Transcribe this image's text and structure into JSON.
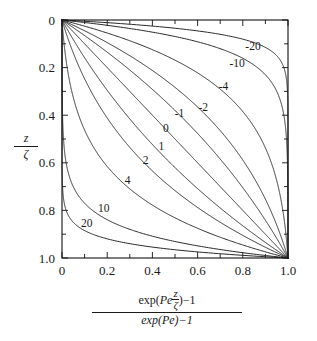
{
  "chart_data": {
    "type": "line",
    "title": "",
    "xlabel": "(exp(Pe z/zeta) - 1) / (exp(Pe) - 1)",
    "ylabel": "z/zeta",
    "xlim": [
      0,
      1
    ],
    "ylim": [
      0,
      1
    ],
    "y_axis_inverted": true,
    "grid": false,
    "legend_position": "inline-curve-labels",
    "x_ticks": [
      "0",
      "0.2",
      "0.4",
      "0.6",
      "0.8",
      "1.0"
    ],
    "x_tick_values": [
      0,
      0.2,
      0.4,
      0.6,
      0.8,
      1.0
    ],
    "y_ticks": [
      "0",
      "0.2",
      "0.4",
      "0.6",
      "0.8",
      "1.0"
    ],
    "y_tick_values": [
      0,
      0.2,
      0.4,
      0.6,
      0.8,
      1.0
    ],
    "minor_tick_step": 0.1,
    "curve_parameter_name": "Pe",
    "curve_formula": "x = (exp(Pe*y) - 1)/(exp(Pe) - 1), y = z/zeta",
    "series": [
      {
        "name": "-20",
        "pe": -20,
        "label": "-20",
        "label_x": 0.845,
        "label_y": 0.115
      },
      {
        "name": "-10",
        "pe": -10,
        "label": "-10",
        "label_x": 0.775,
        "label_y": 0.185
      },
      {
        "name": "-4",
        "pe": -4,
        "label": "-4",
        "label_x": 0.715,
        "label_y": 0.285
      },
      {
        "name": "-2",
        "pe": -2,
        "label": "-2",
        "label_x": 0.625,
        "label_y": 0.37
      },
      {
        "name": "-1",
        "pe": -1,
        "label": "-1",
        "label_x": 0.52,
        "label_y": 0.395
      },
      {
        "name": "0",
        "pe": 0,
        "label": "0",
        "label_x": 0.46,
        "label_y": 0.46
      },
      {
        "name": "1",
        "pe": 1,
        "label": "1",
        "label_x": 0.44,
        "label_y": 0.535
      },
      {
        "name": "2",
        "pe": 2,
        "label": "2",
        "label_x": 0.37,
        "label_y": 0.595
      },
      {
        "name": "4",
        "pe": 4,
        "label": "4",
        "label_x": 0.29,
        "label_y": 0.68
      },
      {
        "name": "10",
        "pe": 10,
        "label": "10",
        "label_x": 0.185,
        "label_y": 0.795
      },
      {
        "name": "20",
        "pe": 20,
        "label": "20",
        "label_x": 0.11,
        "label_y": 0.86
      }
    ]
  },
  "axis_labels": {
    "x_numerator_prefix": "exp",
    "x_numerator_paren_open": "(",
    "x_numerator_pe": "Pe",
    "x_numerator_frac_top": "z",
    "x_numerator_frac_bottom": "ζ",
    "x_numerator_paren_close": ")",
    "x_numerator_minus_one": "−1",
    "x_denominator": "exp(Pe)−1",
    "y_top": "z",
    "y_bottom": "ζ"
  }
}
